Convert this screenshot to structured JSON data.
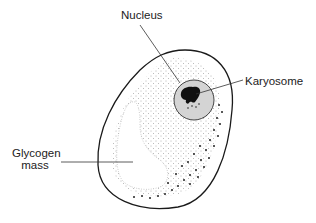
{
  "labels": {
    "nucleus": "Nucleus",
    "karyosome": "Karyosome",
    "glycogen_line1": "Glycogen",
    "glycogen_line2": "mass"
  },
  "colors": {
    "outline": "#1a1a1a",
    "stipple": "#555555",
    "nucleus_fill": "#d4d4d4",
    "karyosome": "#111111",
    "background": "#ffffff"
  }
}
